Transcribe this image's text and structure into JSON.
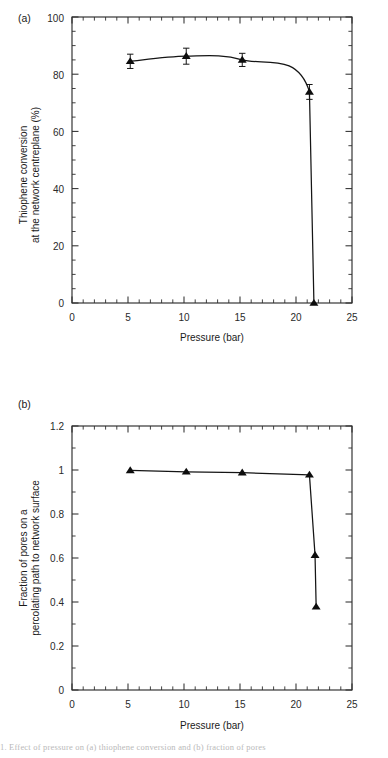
{
  "figure": {
    "background": "#ffffff",
    "line_color": "#151515",
    "marker_color": "#0d0d0d",
    "axis_color": "#2e2e2e",
    "caption_fragment": "1. Effect of pressure on (a) thiophene conversion and (b) fraction of pores"
  },
  "panels": [
    {
      "id": "a",
      "label": "(a)",
      "xlabel": "Pressure (bar)",
      "ylabel_line1": "Thiophene conversion",
      "ylabel_line2": "at the network centreplane (%)",
      "xticks": [
        "0",
        "5",
        "10",
        "15",
        "20",
        "25"
      ],
      "yticks": [
        "0",
        "20",
        "40",
        "60",
        "80",
        "100"
      ]
    },
    {
      "id": "b",
      "label": "(b)",
      "xlabel": "Pressure (bar)",
      "ylabel_line1": "Fraction of pores on a",
      "ylabel_line2": "percolating path to network surface",
      "xticks": [
        "0",
        "5",
        "10",
        "15",
        "20",
        "25"
      ],
      "yticks": [
        "0",
        "0.2",
        "0.4",
        "0.6",
        "0.8",
        "1",
        "1.2"
      ]
    }
  ],
  "chart_data": [
    {
      "type": "line",
      "panel": "a",
      "title": "",
      "xlabel": "Pressure (bar)",
      "ylabel": "Thiophene conversion at the network centreplane (%)",
      "xlim": [
        0,
        25
      ],
      "ylim": [
        0,
        100
      ],
      "xticks": [
        0,
        5,
        10,
        15,
        20,
        25
      ],
      "yticks": [
        0,
        20,
        40,
        60,
        80,
        100
      ],
      "xminor_step": 1,
      "yminor_step": 5,
      "grid": false,
      "legend": "none",
      "marker": "triangle-up",
      "errorbars": true,
      "x": [
        5.2,
        10.2,
        15.2,
        21.2,
        21.6
      ],
      "y": [
        84.5,
        86.3,
        85.0,
        73.8,
        0.0
      ],
      "yerr": [
        2.5,
        2.8,
        2.3,
        2.6,
        0.0
      ],
      "series": [
        {
          "name": "Thiophene conversion",
          "points": [
            {
              "x": 5.2,
              "y": 84.5,
              "yerr": 2.5
            },
            {
              "x": 10.2,
              "y": 86.3,
              "yerr": 2.8
            },
            {
              "x": 15.2,
              "y": 85.0,
              "yerr": 2.3
            },
            {
              "x": 21.2,
              "y": 73.8,
              "yerr": 2.6
            },
            {
              "x": 21.6,
              "y": 0.0,
              "yerr": 0.0
            }
          ]
        }
      ]
    },
    {
      "type": "line",
      "panel": "b",
      "title": "",
      "xlabel": "Pressure (bar)",
      "ylabel": "Fraction of pores on a percolating path to network surface",
      "xlim": [
        0,
        25
      ],
      "ylim": [
        0,
        1.2
      ],
      "xticks": [
        0,
        5,
        10,
        15,
        20,
        25
      ],
      "yticks": [
        0,
        0.2,
        0.4,
        0.6,
        0.8,
        1,
        1.2
      ],
      "xminor_step": 1,
      "yminor_step": 0.1,
      "grid": false,
      "legend": "none",
      "marker": "triangle-up",
      "errorbars": false,
      "x": [
        5.2,
        10.2,
        15.2,
        21.2,
        21.7,
        21.8
      ],
      "y": [
        0.998,
        0.992,
        0.988,
        0.978,
        0.613,
        0.378
      ],
      "series": [
        {
          "name": "Fraction of pores on percolating path",
          "points": [
            {
              "x": 5.2,
              "y": 0.998
            },
            {
              "x": 10.2,
              "y": 0.992
            },
            {
              "x": 15.2,
              "y": 0.988
            },
            {
              "x": 21.2,
              "y": 0.978
            },
            {
              "x": 21.7,
              "y": 0.613
            },
            {
              "x": 21.8,
              "y": 0.378
            }
          ]
        }
      ]
    }
  ]
}
